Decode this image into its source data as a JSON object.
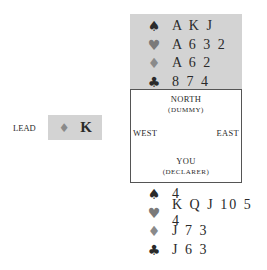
{
  "colors": {
    "spade": "#2a2a2a",
    "heart": "#7a7a7a",
    "diamond": "#8a8a8a",
    "club": "#2a2a2a",
    "box_bg": "#d3d3d3",
    "frame_border": "#555555"
  },
  "suit_symbols": {
    "spades": "♠",
    "hearts": "♥",
    "diamonds": "♦",
    "clubs": "♣"
  },
  "dummy": {
    "spades": "A K J",
    "hearts": "A 6 3 2",
    "diamonds": "A 6 2",
    "clubs": "8 7 4"
  },
  "table": {
    "north": "NORTH",
    "north_sub": "(DUMMY)",
    "west": "WEST",
    "east": "EAST",
    "south": "YOU",
    "south_sub": "(DECLARER)"
  },
  "lead": {
    "label": "LEAD",
    "suit_symbol": "♦",
    "card": "K"
  },
  "declarer": {
    "spades": "4",
    "hearts": "K Q J 10 5 4",
    "diamonds": "J 7 3",
    "clubs": "J 6 3"
  }
}
